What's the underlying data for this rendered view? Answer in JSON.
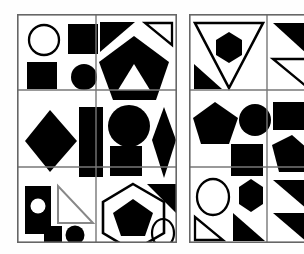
{
  "image": {
    "kind": "abstract-shape-grid",
    "description": "Two bordered panels each containing a 3-row by 2-column grid of abstract geometric shape arrangements",
    "background_color": "#ffffff",
    "ink_color": "#000000",
    "border_color": "#555555",
    "panel_count": 2,
    "grid_rows": 3,
    "grid_cols": 2
  },
  "panels": [
    {
      "name": "left-panel",
      "label": "Left shape grid",
      "x": 17,
      "y": 14,
      "width": 160,
      "height": 229,
      "cells": [
        {
          "name": "cell-r1c1",
          "row": 1,
          "col": 1,
          "shapes": [
            {
              "shape": "circle",
              "fill": "none",
              "stroke": "#000000",
              "position": "top-left"
            },
            {
              "shape": "square",
              "fill": "#000000",
              "stroke": "none",
              "position": "top-right"
            },
            {
              "shape": "square",
              "fill": "#000000",
              "stroke": "none",
              "position": "bottom-left"
            },
            {
              "shape": "circle",
              "fill": "#000000",
              "stroke": "none",
              "position": "bottom-right"
            }
          ]
        },
        {
          "name": "cell-r1c2",
          "row": 1,
          "col": 2,
          "shapes": [
            {
              "shape": "triangle",
              "fill": "#000000",
              "stroke": "none",
              "position": "top-left"
            },
            {
              "shape": "triangle",
              "fill": "none",
              "stroke": "#000000",
              "position": "top-right"
            },
            {
              "shape": "pentagon",
              "fill": "#000000",
              "stroke": "none",
              "position": "center"
            },
            {
              "shape": "triangle",
              "fill": "#ffffff",
              "stroke": "none",
              "position": "center-inner"
            }
          ]
        },
        {
          "name": "cell-r2c1",
          "row": 2,
          "col": 1,
          "shapes": [
            {
              "shape": "diamond",
              "fill": "#000000",
              "stroke": "none",
              "position": "left"
            },
            {
              "shape": "rectangle",
              "fill": "#000000",
              "stroke": "none",
              "position": "right"
            }
          ]
        },
        {
          "name": "cell-r2c2",
          "row": 2,
          "col": 2,
          "shapes": [
            {
              "shape": "circle",
              "fill": "#000000",
              "stroke": "none",
              "position": "top-left"
            },
            {
              "shape": "square",
              "fill": "#000000",
              "stroke": "none",
              "position": "bottom-left"
            },
            {
              "shape": "diamond",
              "fill": "#000000",
              "stroke": "none",
              "position": "right"
            }
          ]
        },
        {
          "name": "cell-r3c1",
          "row": 3,
          "col": 1,
          "shapes": [
            {
              "shape": "rectangle",
              "fill": "#000000",
              "stroke": "none",
              "position": "top-left"
            },
            {
              "shape": "circle",
              "fill": "#ffffff",
              "stroke": "none",
              "position": "inside-rectangle"
            },
            {
              "shape": "right-triangle",
              "fill": "none",
              "stroke": "#000000",
              "position": "top-right"
            },
            {
              "shape": "square",
              "fill": "#000000",
              "stroke": "none",
              "position": "bottom-center"
            },
            {
              "shape": "circle",
              "fill": "#000000",
              "stroke": "none",
              "position": "bottom-right"
            }
          ]
        },
        {
          "name": "cell-r3c2",
          "row": 3,
          "col": 2,
          "shapes": [
            {
              "shape": "triangle",
              "fill": "#000000",
              "stroke": "none",
              "position": "top-right"
            },
            {
              "shape": "hexagon",
              "fill": "none",
              "stroke": "#000000",
              "position": "center"
            },
            {
              "shape": "pentagon",
              "fill": "#000000",
              "stroke": "none",
              "position": "inside-hexagon"
            },
            {
              "shape": "ellipse",
              "fill": "none",
              "stroke": "#000000",
              "position": "bottom-right"
            }
          ]
        }
      ]
    },
    {
      "name": "right-panel",
      "label": "Right shape grid (clipped at image edge)",
      "x": 189,
      "y": 14,
      "width": 118,
      "height": 229,
      "clipped": true,
      "cells": [
        {
          "name": "cell-r1c1",
          "row": 1,
          "col": 1,
          "shapes": [
            {
              "shape": "inverted-triangle",
              "fill": "none",
              "stroke": "#000000",
              "position": "center"
            },
            {
              "shape": "hexagon",
              "fill": "#000000",
              "stroke": "none",
              "position": "inside-triangle"
            },
            {
              "shape": "right-triangle",
              "fill": "#000000",
              "stroke": "none",
              "position": "bottom-left"
            }
          ]
        },
        {
          "name": "cell-r1c2",
          "row": 1,
          "col": 2,
          "shapes": [
            {
              "shape": "right-triangle",
              "fill": "#000000",
              "stroke": "none",
              "position": "top"
            },
            {
              "shape": "right-triangle",
              "fill": "none",
              "stroke": "#000000",
              "position": "bottom"
            }
          ]
        },
        {
          "name": "cell-r2c1",
          "row": 2,
          "col": 1,
          "shapes": [
            {
              "shape": "pentagon",
              "fill": "#000000",
              "stroke": "none",
              "position": "top-left"
            },
            {
              "shape": "circle",
              "fill": "#000000",
              "stroke": "none",
              "position": "top-right"
            },
            {
              "shape": "square",
              "fill": "#000000",
              "stroke": "none",
              "position": "bottom-center"
            }
          ]
        },
        {
          "name": "cell-r2c2",
          "row": 2,
          "col": 2,
          "shapes": [
            {
              "shape": "rectangle",
              "fill": "#000000",
              "stroke": "none",
              "position": "top"
            },
            {
              "shape": "pentagon",
              "fill": "#000000",
              "stroke": "none",
              "position": "bottom"
            }
          ]
        },
        {
          "name": "cell-r3c1",
          "row": 3,
          "col": 1,
          "shapes": [
            {
              "shape": "circle",
              "fill": "none",
              "stroke": "#000000",
              "position": "top-left"
            },
            {
              "shape": "hexagon",
              "fill": "#000000",
              "stroke": "none",
              "position": "top-right"
            },
            {
              "shape": "right-triangle",
              "fill": "none",
              "stroke": "#000000",
              "position": "bottom-left"
            },
            {
              "shape": "right-triangle",
              "fill": "#000000",
              "stroke": "none",
              "position": "bottom-right"
            }
          ]
        },
        {
          "name": "cell-r3c2",
          "row": 3,
          "col": 2,
          "shapes": [
            {
              "shape": "right-triangle",
              "fill": "#000000",
              "stroke": "none",
              "position": "top"
            },
            {
              "shape": "right-triangle",
              "fill": "#000000",
              "stroke": "none",
              "position": "bottom"
            }
          ]
        }
      ]
    }
  ]
}
